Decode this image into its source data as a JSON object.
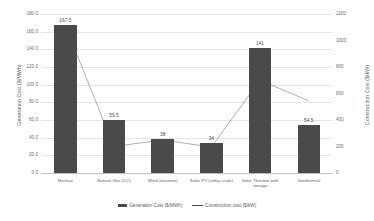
{
  "chart_data": {
    "type": "bar",
    "title": "",
    "categories": [
      "Nuclear",
      "Natural Gas (CC)",
      "Wind (onshore)",
      "Solar PV (utility-scale)",
      "Solar Thermal with storage",
      "Geothermal"
    ],
    "series": [
      {
        "name": "Generation Cost ($/MWh)",
        "type": "bar",
        "axis": "left",
        "color": "#4a4a4a",
        "values": [
          167.5,
          59.5,
          38,
          34,
          141,
          54.5
        ],
        "labels": [
          "167.5",
          "59.5",
          "38",
          "34",
          "141",
          "54.5"
        ]
      },
      {
        "name": "Construction cost ($/kW)",
        "type": "line",
        "axis": "right",
        "color": "#4a4a4a",
        "values": [
          1110,
          200,
          250,
          195,
          700,
          545
        ]
      }
    ],
    "xlabel": "",
    "ylabel": "Generation Cost ($/MWh)",
    "y2label": "Construction Cost ($/kW)",
    "ylim": [
      0,
      180
    ],
    "y2lim": [
      0,
      1200
    ],
    "yticks": [
      0,
      20,
      40,
      60,
      80,
      100,
      120,
      140,
      160,
      180
    ],
    "ytick_labels": [
      "0.0",
      "20.0",
      "40.0",
      "60.0",
      "80.0",
      "100.0",
      "120.0",
      "140.0",
      "160.0",
      "180.0"
    ],
    "y2ticks": [
      0,
      200,
      400,
      600,
      800,
      1000,
      1200
    ],
    "y2tick_labels": [
      "0",
      "200",
      "400",
      "600",
      "800",
      "1000",
      "1200"
    ],
    "grid": true,
    "legend_position": "bottom"
  },
  "axes": {
    "left_title": "Generation Cost ($/MWh)",
    "right_title": "Construction Cost ($/kW)"
  },
  "legend": {
    "items": [
      {
        "label": "Generation Cost ($/MWh)",
        "marker": "bar-swatch-icon"
      },
      {
        "label": "Construction cost ($/kW)",
        "marker": "line-swatch-icon"
      }
    ]
  }
}
